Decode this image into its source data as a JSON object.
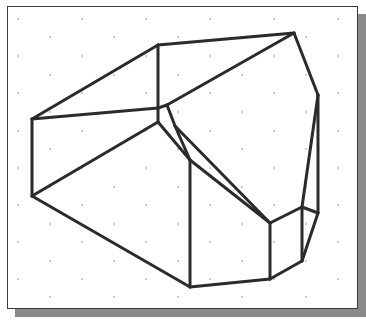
{
  "figure": {
    "type": "isometric-wireframe-solid",
    "frame": {
      "x": 7,
      "y": 6,
      "w": 351,
      "h": 303,
      "border_color": "#3a3a3a"
    },
    "shadow": {
      "offset_x": 8,
      "offset_y": 8,
      "color": "#8a8a8a"
    },
    "grid": {
      "dot_color": "#8c8c8c",
      "dot_radius": 0.8,
      "rows": [
        {
          "y": 19,
          "xs": [
            18,
            82,
            146,
            210,
            274,
            338
          ]
        },
        {
          "y": 37,
          "xs": [
            50,
            114,
            178,
            242,
            306
          ]
        },
        {
          "y": 56,
          "xs": [
            18,
            82,
            146,
            210,
            274,
            338
          ]
        },
        {
          "y": 75,
          "xs": [
            50,
            114,
            178,
            242,
            306
          ]
        },
        {
          "y": 93,
          "xs": [
            18,
            82,
            146,
            210,
            274,
            338
          ]
        },
        {
          "y": 112,
          "xs": [
            50,
            114,
            178,
            242,
            306
          ]
        },
        {
          "y": 131,
          "xs": [
            18,
            82,
            146,
            210,
            274,
            338
          ]
        },
        {
          "y": 149,
          "xs": [
            50,
            114,
            178,
            242,
            306
          ]
        },
        {
          "y": 168,
          "xs": [
            18,
            82,
            146,
            210,
            274,
            338
          ]
        },
        {
          "y": 187,
          "xs": [
            50,
            114,
            178,
            242,
            306
          ]
        },
        {
          "y": 205,
          "xs": [
            18,
            82,
            146,
            210,
            274,
            338
          ]
        },
        {
          "y": 224,
          "xs": [
            50,
            114,
            178,
            242,
            306
          ]
        },
        {
          "y": 242,
          "xs": [
            18,
            82,
            146,
            210,
            274,
            338
          ]
        },
        {
          "y": 261,
          "xs": [
            50,
            114,
            178,
            242,
            306
          ]
        },
        {
          "y": 279,
          "xs": [
            18,
            82,
            146,
            210,
            274,
            338
          ]
        },
        {
          "y": 297,
          "xs": [
            50,
            114,
            178,
            242,
            306
          ]
        }
      ]
    },
    "stroke": {
      "color": "#2b2b2b",
      "width": 3
    },
    "edges": [
      [
        32,
        119,
        158,
        45
      ],
      [
        158,
        45,
        294,
        33
      ],
      [
        294,
        33,
        318,
        95
      ],
      [
        32,
        119,
        158,
        108
      ],
      [
        158,
        45,
        158,
        108
      ],
      [
        158,
        108,
        167,
        105
      ],
      [
        167,
        105,
        294,
        33
      ],
      [
        158,
        108,
        158,
        122
      ],
      [
        158,
        122,
        32,
        196
      ],
      [
        32,
        119,
        32,
        196
      ],
      [
        158,
        122,
        190,
        160
      ],
      [
        167,
        105,
        175,
        126
      ],
      [
        175,
        126,
        190,
        160
      ],
      [
        32,
        196,
        190,
        287
      ],
      [
        190,
        160,
        190,
        287
      ],
      [
        190,
        287,
        270,
        279
      ],
      [
        270,
        279,
        302,
        261
      ],
      [
        302,
        261,
        318,
        213
      ],
      [
        318,
        213,
        318,
        95
      ],
      [
        175,
        126,
        270,
        223
      ],
      [
        190,
        160,
        270,
        223
      ],
      [
        270,
        223,
        270,
        279
      ],
      [
        270,
        223,
        302,
        207
      ],
      [
        302,
        207,
        302,
        261
      ],
      [
        302,
        207,
        318,
        213
      ],
      [
        302,
        207,
        318,
        95
      ]
    ]
  }
}
